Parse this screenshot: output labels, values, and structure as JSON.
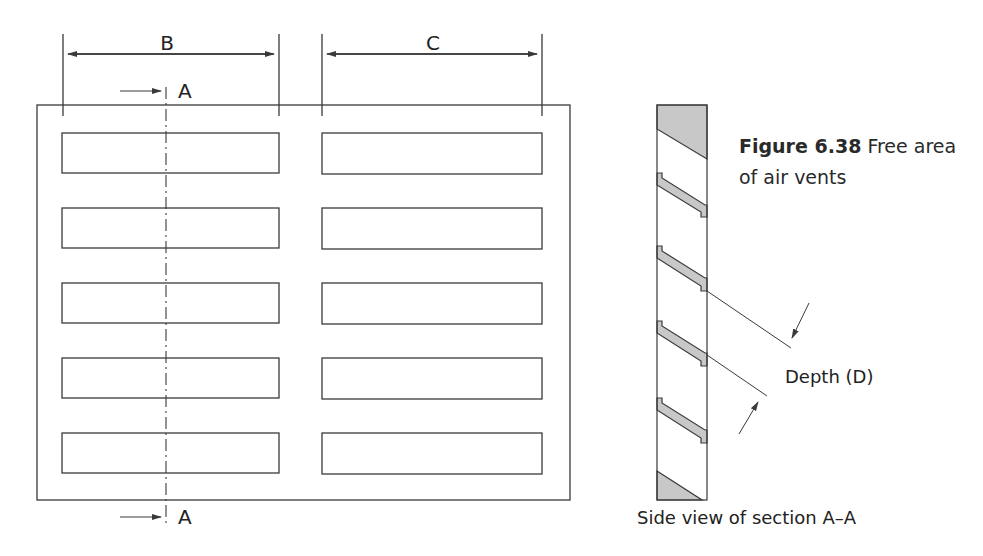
{
  "figure": {
    "number": "Figure 6.38",
    "title": "Free area of air vents"
  },
  "front_view": {
    "dimension_labels": {
      "left_slot_width": "B",
      "right_slot_width": "C"
    },
    "section_marker_label": "A",
    "slot_rows": 5,
    "slot_columns": 2
  },
  "side_view": {
    "caption": "Side view of section A–A",
    "depth_label": "Depth (D)"
  },
  "colors": {
    "line": "#3a3a3a",
    "fill_grey": "#c8c8c8"
  }
}
